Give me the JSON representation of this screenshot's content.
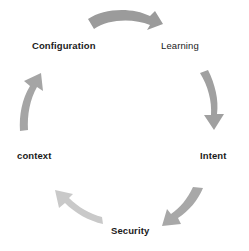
{
  "diagram": {
    "type": "cycle",
    "title": "",
    "direction": "clockwise",
    "background_color": "#ffffff",
    "nodes": [
      {
        "id": "configuration",
        "label": "Configuration",
        "weight": "bold",
        "position": "top-left"
      },
      {
        "id": "learning",
        "label": "Learning",
        "weight": "regular",
        "position": "top-right"
      },
      {
        "id": "intent",
        "label": "Intent",
        "weight": "bold",
        "position": "right"
      },
      {
        "id": "security",
        "label": "Security",
        "weight": "bold",
        "position": "bottom"
      },
      {
        "id": "context",
        "label": "context",
        "weight": "bold",
        "position": "left"
      }
    ],
    "arrows": [
      {
        "id": "arrow-configuration-to-learning",
        "name": "top-arrow",
        "from": "configuration",
        "to": "learning",
        "color": "#9b9b9b",
        "direction": "right-down"
      },
      {
        "id": "arrow-learning-to-intent",
        "name": "right-arrow",
        "from": "learning",
        "to": "intent",
        "color": "#a0a0a0",
        "direction": "down"
      },
      {
        "id": "arrow-intent-to-security",
        "name": "bottom-right-arrow",
        "from": "intent",
        "to": "security",
        "color": "#a8a8a8",
        "direction": "down-left"
      },
      {
        "id": "arrow-security-to-context",
        "name": "bottom-left-arrow",
        "from": "security",
        "to": "context",
        "color": "#c9c9c9",
        "direction": "up-left"
      },
      {
        "id": "arrow-context-to-configuration",
        "name": "left-arrow",
        "from": "context",
        "to": "configuration",
        "color": "#a5a5a5",
        "direction": "up"
      }
    ],
    "colors": {
      "text": "#1b1b1b",
      "arrow_dark": "#9b9b9b",
      "arrow_mid": "#a8a8a8",
      "arrow_light": "#c9c9c9"
    }
  }
}
